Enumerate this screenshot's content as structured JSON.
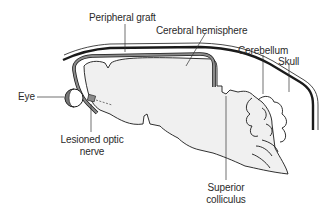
{
  "diagram": {
    "labels": {
      "peripheral_graft": "Peripheral graft",
      "cerebral_hemisphere": "Cerebral hemisphere",
      "cerebellum": "Cerebellum",
      "skull": "Skull",
      "eye": "Eye",
      "lesioned_optic_nerve_line1": "Lesioned optic",
      "lesioned_optic_nerve_line2": "nerve",
      "superior_colliculus_line1": "Superior",
      "superior_colliculus_line2": "colliculus"
    },
    "colors": {
      "brain_fill": "#f0f0f0",
      "outline": "#1a1a1a",
      "graft": "#8a8a8a",
      "eye_fill": "#777777",
      "leader_line": "#333333",
      "text": "#2a2a2a"
    }
  }
}
